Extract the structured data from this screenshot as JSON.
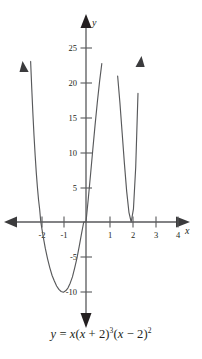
{
  "figure": {
    "caption": "y = x(x + 2)³(x − 2)²",
    "equation_parts": {
      "lhs": "y",
      "equals": "=",
      "factor1": "x",
      "factor2_open": "(",
      "factor2_var": "x",
      "factor2_plus": "+",
      "factor2_num": "2",
      "factor2_close": ")",
      "exp2": "3",
      "factor3_open": "(",
      "factor3_var": "x",
      "factor3_minus": "−",
      "factor3_num": "2",
      "factor3_close": ")",
      "exp3": "2"
    }
  },
  "axes": {
    "x_axis_label": "x",
    "y_axis_label": "y",
    "x_ticks": [
      "-2",
      "-1",
      "1",
      "2",
      "3",
      "4"
    ],
    "y_ticks": [
      "25",
      "20",
      "15",
      "10",
      "5",
      "-5",
      "-10"
    ],
    "line_color": "#58595b",
    "curve_color": "#58595b"
  },
  "chart_data": {
    "type": "line",
    "title": "",
    "subtitle": "",
    "xlabel": "x",
    "ylabel": "y",
    "caption": "y = x(x + 2)^3(x - 2)^2",
    "function": "y = x(x + 2)^3(x - 2)^2",
    "xlim": [
      -2.9,
      4.3
    ],
    "ylim": [
      -13.5,
      29
    ],
    "grid": false,
    "legend": null,
    "x_tick_values": [
      -2,
      -1,
      1,
      2,
      3,
      4
    ],
    "x_tick_labels": [
      "-2",
      "-1",
      "1",
      "2",
      "3",
      "4"
    ],
    "y_tick_values": [
      25,
      20,
      15,
      10,
      5,
      -5,
      -10
    ],
    "y_tick_labels": [
      "25",
      "20",
      "15",
      "10",
      "5",
      "-5",
      "-10"
    ],
    "roots": [
      {
        "x": -2,
        "multiplicity": 3,
        "behavior": "crosses-flattened"
      },
      {
        "x": 0,
        "multiplicity": 1,
        "behavior": "crosses"
      },
      {
        "x": 2,
        "multiplicity": 2,
        "behavior": "touches"
      }
    ],
    "annotations": [
      {
        "text": "arrow up on left branch",
        "x": -2.4,
        "y": 23
      },
      {
        "text": "arrow up on right branch",
        "x": 2.45,
        "y": 24
      },
      {
        "text": "arrow left on x-axis",
        "x": -2.8,
        "y": 0
      },
      {
        "text": "arrow right on x-axis",
        "x": 4.2,
        "y": 0
      },
      {
        "text": "arrow up on y-axis",
        "x": 0,
        "y": 28
      },
      {
        "text": "arrow down on y-axis",
        "x": 0,
        "y": -13
      }
    ],
    "local_extrema": [
      {
        "type": "local-max",
        "x": 1.0,
        "y": 27
      },
      {
        "type": "local-min",
        "x": -0.95,
        "y": -11
      },
      {
        "type": "local-min",
        "x": 2.0,
        "y": 0
      }
    ],
    "series": [
      {
        "name": "y = x(x + 2)^3(x - 2)^2",
        "x": [
          -2.45,
          -2.4,
          -2.35,
          -2.3,
          -2.25,
          -2.2,
          -2.15,
          -2.1,
          -2.05,
          -2.0,
          -1.9,
          -1.8,
          -1.7,
          -1.6,
          -1.5,
          -1.4,
          -1.3,
          -1.2,
          -1.1,
          -1.0,
          -0.9,
          -0.8,
          -0.7,
          -0.6,
          -0.5,
          -0.4,
          -0.3,
          -0.2,
          -0.1,
          0.0,
          0.1,
          0.2,
          0.3,
          0.4,
          0.5,
          0.6,
          0.7,
          0.8,
          0.9,
          1.0,
          1.1,
          1.2,
          1.3,
          1.4,
          1.5,
          1.6,
          1.7,
          1.8,
          1.9,
          2.0,
          2.1,
          2.2,
          2.3,
          2.4,
          2.45
        ],
        "y": [
          23.1,
          19.2,
          15.6,
          12.4,
          9.6,
          7.1,
          5.0,
          3.2,
          1.8,
          0.0,
          -2.0,
          -3.8,
          -5.3,
          -6.6,
          -7.7,
          -8.5,
          -9.2,
          -9.7,
          -10.0,
          -10.1,
          -9.9,
          -9.5,
          -8.8,
          -7.9,
          -6.6,
          -5.2,
          -3.5,
          -1.7,
          0.0,
          0.0,
          3.3,
          6.8,
          10.4,
          13.9,
          17.2,
          20.2,
          22.8,
          24.8,
          26.2,
          27.0,
          27.0,
          26.0,
          24.0,
          21.0,
          17.2,
          12.8,
          8.4,
          4.4,
          1.4,
          0.0,
          1.9,
          7.9,
          18.5,
          34.4,
          45.0
        ]
      }
    ]
  }
}
